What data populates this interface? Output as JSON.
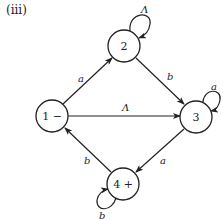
{
  "figure": {
    "panel_label": "(iii)",
    "type": "finite automaton / transition graph",
    "states": [
      {
        "id": "1",
        "label": "1 −",
        "start": true,
        "final": false,
        "cx": 52,
        "cy": 116
      },
      {
        "id": "2",
        "label": "2",
        "start": false,
        "final": false,
        "cx": 124,
        "cy": 46
      },
      {
        "id": "3",
        "label": "3",
        "start": false,
        "final": false,
        "cx": 196,
        "cy": 117
      },
      {
        "id": "4",
        "label": "4 +",
        "start": false,
        "final": true,
        "cx": 123,
        "cy": 184
      }
    ],
    "edges": [
      {
        "from": "1",
        "to": "2",
        "label": "a"
      },
      {
        "from": "2",
        "to": "2",
        "label": "Λ"
      },
      {
        "from": "2",
        "to": "3",
        "label": "b"
      },
      {
        "from": "1",
        "to": "3",
        "label": "Λ"
      },
      {
        "from": "3",
        "to": "3",
        "label": "a"
      },
      {
        "from": "3",
        "to": "4",
        "label": "a"
      },
      {
        "from": "4",
        "to": "1",
        "label": "b"
      },
      {
        "from": "4",
        "to": "4",
        "label": "b"
      }
    ]
  }
}
